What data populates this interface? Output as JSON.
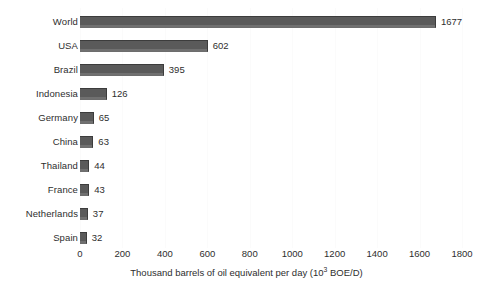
{
  "chart_data": {
    "type": "bar",
    "orientation": "horizontal",
    "title": "",
    "xlabel": "Thousand barrels of oil equivalent per day (10³ BOE/D)",
    "xlabel_text": "Thousand barrels of oil equivalent per day (10",
    "xlabel_sup": "3",
    "xlabel_tail": " BOE/D)",
    "ylabel": "",
    "categories": [
      "World",
      "USA",
      "Brazil",
      "Indonesia",
      "Germany",
      "China",
      "Thailand",
      "France",
      "Netherlands",
      "Spain"
    ],
    "values": [
      1677,
      602,
      395,
      126,
      65,
      63,
      44,
      43,
      37,
      32
    ],
    "data_labels": [
      "1677",
      "602",
      "395",
      "126",
      "65",
      "63",
      "44",
      "43",
      "37",
      "32"
    ],
    "xlim": [
      0,
      1800
    ],
    "xticks": [
      0,
      200,
      400,
      600,
      800,
      1000,
      1200,
      1400,
      1600,
      1800
    ],
    "xtick_labels": [
      "0",
      "200",
      "400",
      "600",
      "800",
      "1000",
      "1200",
      "1400",
      "1600",
      "1800"
    ],
    "grid": true,
    "grid_axis": "x",
    "legend": false,
    "legend_position": "none",
    "bar_color": "#5a5a5a",
    "bar_edge_color": "#3c3c3c",
    "grid_color": "#fbfbfb",
    "background_color": "#ffffff",
    "text_color": "#2e2e2e"
  }
}
